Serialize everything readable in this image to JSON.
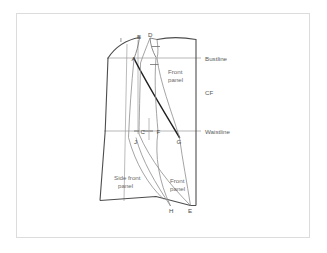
{
  "figure": {
    "name": "bodice-pattern-draft",
    "frame": {
      "visible": true,
      "border_color": "#dcdcdc"
    },
    "colors": {
      "outline": "#4d4d4d",
      "construction": "#8d8d8d",
      "guideline": "#9a9a9a",
      "emphasis": "#1f1f1f",
      "background": "#ffffff",
      "text": "#5b5b5b"
    }
  },
  "guidelines": [
    {
      "id": "bustline",
      "label": "Bustline",
      "label_x": 205,
      "label_y": 62,
      "y": 58,
      "x1": 107,
      "x2": 197
    },
    {
      "id": "waistline",
      "label": "Waistline",
      "label_x": 205,
      "label_y": 134,
      "y": 131,
      "x1": 104,
      "x2": 197
    }
  ],
  "annotations": [
    {
      "id": "cf",
      "label": "CF",
      "x": 205,
      "y": 93
    },
    {
      "id": "front-panel-upper",
      "label": "Front",
      "x": 169,
      "y": 72
    },
    {
      "id": "front-panel-upper-2",
      "label": "panel",
      "x": 169,
      "y": 80
    },
    {
      "id": "side-front-panel",
      "label": "Side front",
      "x": 117,
      "y": 178
    },
    {
      "id": "side-front-panel-2",
      "label": "panel",
      "x": 117,
      "y": 186
    },
    {
      "id": "front-panel-lower",
      "label": "Front",
      "x": 172,
      "y": 181
    },
    {
      "id": "front-panel-lower-2",
      "label": "panel",
      "x": 172,
      "y": 189
    }
  ],
  "points": [
    {
      "id": "A",
      "label": "A",
      "x": 134,
      "y": 59
    },
    {
      "id": "B",
      "label": "B",
      "x": 140,
      "y": 37
    },
    {
      "id": "C",
      "label": "C",
      "x": 140,
      "y": 133
    },
    {
      "id": "D",
      "label": "D",
      "x": 150,
      "y": 35
    },
    {
      "id": "E",
      "label": "E",
      "x": 190,
      "y": 211
    },
    {
      "id": "F",
      "label": "F",
      "x": 158,
      "y": 133
    },
    {
      "id": "G",
      "label": "G",
      "x": 178,
      "y": 142
    },
    {
      "id": "H",
      "label": "H",
      "x": 171,
      "y": 211
    },
    {
      "id": "I",
      "label": "I",
      "x": 121,
      "y": 40
    },
    {
      "id": "J",
      "label": "J",
      "x": 136,
      "y": 142
    }
  ],
  "paths": {
    "center_front": "M 196 39 L 196 205",
    "shoulder_outer": "M 108 58 C 116 45 128 39 140 37",
    "neck_top": "M 156 39 C 170 36 184 37 196 39",
    "side_seam_left": "M 108 58 L 105 131 L 100 200",
    "hem": "M 100 200 L 155 196 L 190 205",
    "hem_right": "M 190 205 L 196 205",
    "armhole_right": "M 196 39 L 196 205",
    "princess_main": "M 134 58 C 148 84 166 112 180 137",
    "dart_left_upper": "M 140 37 C 139 44 137 51 134 58",
    "dart_right_upper": "M 150 37 C 151 44 153 50 156 57",
    "dart_inner_curve": "M 150 37 C 147 46 144 54 141 62",
    "seam_a_to_j": "M 134 58 C 132 85 130 110 129 137",
    "seam_c_down": "M 140 62 C 140 95 139 120 139 134",
    "vertical_guide_1": "M 127 44 L 124 200",
    "vertical_guide_2": "M 138 40 L 138 134",
    "curve_c_to_e": "M 139 134 C 150 160 170 185 190 205",
    "curve_f_to_h": "M 158 131 C 155 155 160 180 171 206",
    "curve_j_to_h": "M 136 137 C 142 160 155 182 171 206",
    "curve_g_up": "M 180 137 C 172 110 160 80 156 57",
    "curve_g_down": "M 180 137 C 182 160 186 182 190 205",
    "lower_cross": "M 129 137 C 136 162 150 185 164 200"
  },
  "ticks": [
    {
      "id": "tick-bust-1",
      "x1": 152,
      "y1": 46,
      "x2": 160,
      "y2": 46
    },
    {
      "id": "tick-bust-2",
      "x1": 150,
      "y1": 64,
      "x2": 158,
      "y2": 64
    },
    {
      "id": "tick-waist-1",
      "x1": 144,
      "y1": 131,
      "x2": 152,
      "y2": 131
    },
    {
      "id": "tick-waist-vert",
      "x1": 149,
      "y1": 119,
      "x2": 149,
      "y2": 140
    }
  ]
}
